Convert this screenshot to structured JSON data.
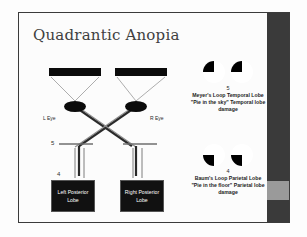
{
  "slide": {
    "title": "Quadrantic Anopia",
    "background_color": "#fcfcfc",
    "frame_color": "#3b3b3b",
    "sidebar_color": "#3a3a3a",
    "sidebar_band_color": "#9a9a9a"
  },
  "diagram": {
    "eye_left_label": "L Eye",
    "eye_right_label": "R Eye",
    "branch_label_upper": "5",
    "branch_label_lower": "4",
    "lobe_left_label": "Left Posterior Lobe",
    "lobe_right_label": "Right Posterior Lobe",
    "structure_color": "#0b0b0b",
    "lobe_box_color": "#111111",
    "lobe_text_color": "#ffffff"
  },
  "defects": [
    {
      "number": "5",
      "caption": "Meyer's Loop Temporal Lobe  \"Pie in the sky\" Temporal lobe damage",
      "filled_quadrants": [
        "upper-left",
        "upper-left"
      ],
      "fill_color": "#000000"
    },
    {
      "number": "4",
      "caption": "Baum's Loop Parietal Lobe \"Pie in the floor\" Parietal lobe damage",
      "filled_quadrants": [
        "lower-left",
        "lower-left"
      ],
      "fill_color": "#000000"
    }
  ]
}
